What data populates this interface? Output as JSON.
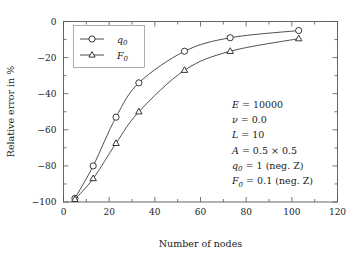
{
  "chart_data": {
    "type": "line",
    "title": "",
    "xlabel": "Number of nodes",
    "ylabel": "Relative error in %",
    "xlim": [
      0,
      120
    ],
    "ylim": [
      -100,
      0
    ],
    "grid": false,
    "legend_position": "top-left",
    "xticks": [
      "0",
      "20",
      "40",
      "60",
      "80",
      "100",
      "120"
    ],
    "xtick_values": [
      0,
      20,
      40,
      60,
      80,
      100,
      120
    ],
    "xminor_values": [
      10,
      30,
      50,
      70,
      90,
      110
    ],
    "yticks": [
      "0",
      "-20",
      "-40",
      "-60",
      "-80",
      "-100"
    ],
    "ytick_values": [
      0,
      -20,
      -40,
      -60,
      -80,
      -100
    ],
    "yminor_values": [
      -10,
      -30,
      -50,
      -70,
      -90
    ],
    "x": [
      5,
      13,
      23,
      33,
      53,
      73,
      103
    ],
    "series": [
      {
        "name": "q_0",
        "label": "q",
        "sub": "0",
        "marker": "circle",
        "color": "#3a3a3a",
        "values": [
          -98,
          -80,
          -53,
          -34,
          -16.5,
          -9,
          -5
        ]
      },
      {
        "name": "F_0",
        "label": "F",
        "sub": "0",
        "marker": "triangle",
        "color": "#3a3a3a",
        "values": [
          -98.5,
          -87,
          -67.5,
          -50,
          -27,
          -16.5,
          -9.5
        ]
      }
    ],
    "annotations": [
      {
        "lhs": "E",
        "rel": "=",
        "rhs": "10000"
      },
      {
        "lhs": "ν",
        "rel": "=",
        "rhs": "0.0"
      },
      {
        "lhs": "L",
        "rel": "=",
        "rhs": "10"
      },
      {
        "lhs": "A",
        "rel": "=",
        "rhs": "0.5 × 0.5"
      },
      {
        "lhs": "q",
        "sub": "0",
        "rel": "=",
        "rhs": "1 (neg. Z)"
      },
      {
        "lhs": "F",
        "sub": "0",
        "rel": "=",
        "rhs": "0.1 (neg. Z)"
      }
    ]
  },
  "colors": {
    "line": "#3a3a3a",
    "frame": "#555555",
    "text": "#1a1a1a",
    "background": "#ffffff"
  }
}
